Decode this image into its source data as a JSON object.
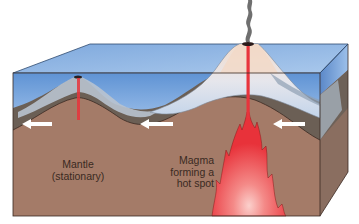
{
  "figure": {
    "type": "cross-section diagram",
    "colors": {
      "ocean_top": "#8fb8e6",
      "ocean_front": "#6e9fd8",
      "lithosphere": "#6b5f55",
      "mantle": "#a47b68",
      "volcano_rock": "#c9d6e6",
      "volcano_core": "#f2d9c8",
      "magma": "#e8343c",
      "magma_glow": "#f7a2a0",
      "smoke": "#6f6f6f",
      "arrow": "#ffffff"
    },
    "arrows": [
      {
        "direction": "left",
        "x": 22,
        "y": 124
      },
      {
        "direction": "left",
        "x": 140,
        "y": 124
      },
      {
        "direction": "left",
        "x": 273,
        "y": 124
      }
    ]
  },
  "labels": {
    "mantle": {
      "line1": "Mantle",
      "line2": "(stationary)"
    },
    "magma": {
      "line1": "Magma",
      "line2": "forming a",
      "line3": "hot spot"
    }
  }
}
